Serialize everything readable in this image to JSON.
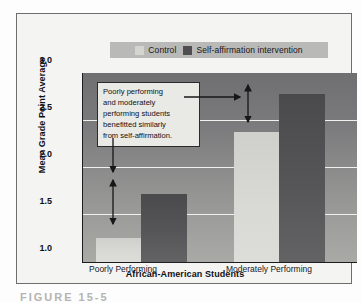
{
  "chart_data": {
    "type": "bar",
    "title": "",
    "xlabel": "African-American Students",
    "ylabel": "Mean Grade Point Average",
    "categories": [
      "Poorly Performing",
      "Moderately Performing"
    ],
    "series": [
      {
        "name": "Control",
        "values": [
          1.25,
          2.38
        ],
        "color": "#d7d7d3"
      },
      {
        "name": "Self-affirmation intervention",
        "values": [
          1.72,
          2.78
        ],
        "color": "#535355"
      }
    ],
    "ylim": [
      1.0,
      3.0
    ],
    "yticks": [
      "1.0",
      "1.5",
      "2.0",
      "2.5",
      "3.0"
    ],
    "ytick_values": [
      1.0,
      1.5,
      2.0,
      2.5,
      3.0
    ],
    "grid": true,
    "legend_position": "top-center",
    "annotations": [
      {
        "text": "Poorly performing and moderately performing students benefitted similarly from self-affirmation.",
        "lines": [
          "Poorly performing",
          "and moderately",
          "performing students",
          "benefitted similarly",
          "from self-affirmation."
        ]
      },
      {
        "type": "double-arrow",
        "group": "Poorly Performing",
        "from": 1.25,
        "to": 1.72
      },
      {
        "type": "double-arrow",
        "group": "Moderately Performing",
        "from": 2.38,
        "to": 2.78
      }
    ]
  },
  "legend": {
    "entries": [
      {
        "label": "Control",
        "swatch": "control-swatch"
      },
      {
        "label": "Self-affirmation intervention",
        "swatch": "intervention-swatch"
      }
    ]
  },
  "axes": {
    "y_title": "Mean Grade Point Average",
    "x_title": "African-American Students",
    "y_ticks": [
      "3.0",
      "2.5",
      "2.0",
      "1.5",
      "1.0"
    ],
    "x_ticks": [
      "Poorly Performing",
      "Moderately Performing"
    ]
  },
  "annotation": {
    "line1": "Poorly performing",
    "line2": "and moderately",
    "line3": "performing students",
    "line4": "benefitted similarly",
    "line5": "from self-affirmation."
  },
  "caption": {
    "text": "FIGURE 15-5"
  },
  "colors": {
    "control_bar": "#d7d7d3",
    "intervention_bar": "#535355",
    "plot_background_top": "#6f6f71",
    "plot_background_bottom": "#a9a9a6",
    "gridline": "#f0f0ec",
    "legend_band": "#b9b9b7",
    "frame_border": "#6e6e6e"
  }
}
